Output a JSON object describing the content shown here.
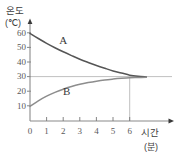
{
  "chart_data": {
    "type": "line",
    "title": "",
    "xlabel": "시간",
    "xunit": "(분)",
    "ylabel": "온도",
    "yunit": "(℃)",
    "xlim": [
      0,
      7.2
    ],
    "ylim": [
      0,
      65
    ],
    "xticks": [
      0,
      1,
      2,
      3,
      4,
      5,
      6
    ],
    "yticks": [
      10,
      20,
      30,
      40,
      50,
      60
    ],
    "grid": false,
    "asymptote": 30,
    "guide_x": 6,
    "series": [
      {
        "name": "A",
        "label": "A",
        "color": "#555555",
        "start": 60,
        "end": 30,
        "x": [
          0,
          0.5,
          1,
          1.5,
          2,
          2.5,
          3,
          3.5,
          4,
          4.5,
          5,
          5.5,
          6,
          6.5,
          7
        ],
        "values": [
          60,
          56.5,
          53.2,
          50.2,
          47.4,
          44.8,
          42.3,
          40.1,
          38.0,
          36.1,
          34.3,
          32.9,
          31.4,
          30.6,
          30.2
        ]
      },
      {
        "name": "B",
        "label": "B",
        "color": "#8a8a8a",
        "start": 10,
        "end": 30,
        "x": [
          0,
          0.5,
          1,
          1.5,
          2,
          2.5,
          3,
          3.5,
          4,
          4.5,
          5,
          5.5,
          6,
          6.5,
          7
        ],
        "values": [
          10,
          13.8,
          17.0,
          19.6,
          21.8,
          23.6,
          25.1,
          26.3,
          27.3,
          28.1,
          28.7,
          29.2,
          29.6,
          29.8,
          30.0
        ]
      }
    ],
    "annotations": [
      {
        "name": "label-A",
        "text": "A",
        "x": 2.0,
        "y": 53
      },
      {
        "name": "label-B",
        "text": "B",
        "x": 2.2,
        "y": 18
      }
    ]
  },
  "axis": {
    "y_title": "온도",
    "y_unit": "(℃)",
    "x_title": "시간",
    "x_unit": "(분)",
    "origin_label": "0"
  }
}
